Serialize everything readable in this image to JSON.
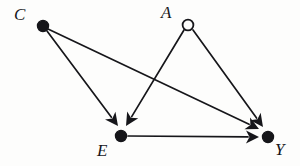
{
  "figure": {
    "kind": "causal-dag",
    "background_color": "#fdfdfc",
    "ink_color": "#16161a",
    "width": 300,
    "height": 166
  },
  "nodes": [
    {
      "id": "C",
      "label": "C",
      "marker": "filled-circle",
      "x": 43,
      "y": 26,
      "radius": 5.6,
      "fill": "#16161a",
      "stroke": "#16161a",
      "label_x": 14,
      "label_y": 6
    },
    {
      "id": "A",
      "label": "A",
      "marker": "open-circle",
      "x": 188,
      "y": 25,
      "radius": 5.4,
      "fill": "#fdfdfc",
      "stroke": "#16161a",
      "label_x": 161,
      "label_y": 4
    },
    {
      "id": "E",
      "label": "E",
      "marker": "filled-circle",
      "x": 121,
      "y": 136,
      "radius": 5.6,
      "fill": "#16161a",
      "stroke": "#16161a",
      "label_x": 97,
      "label_y": 142
    },
    {
      "id": "Y",
      "label": "Y",
      "marker": "filled-circle",
      "x": 268,
      "y": 137,
      "radius": 5.6,
      "fill": "#16161a",
      "stroke": "#16161a",
      "label_x": 275,
      "label_y": 141
    }
  ],
  "edges": [
    {
      "id": "C-E",
      "from": "C",
      "to": "E",
      "arrowhead": "filled-triangle",
      "x1": 47,
      "y1": 31,
      "x2": 118,
      "y2": 126
    },
    {
      "id": "C-Y",
      "from": "C",
      "to": "Y",
      "arrowhead": "filled-triangle",
      "x1": 48,
      "y1": 29,
      "x2": 259,
      "y2": 129
    },
    {
      "id": "A-E",
      "from": "A",
      "to": "E",
      "arrowhead": "filled-triangle",
      "x1": 184,
      "y1": 30,
      "x2": 126,
      "y2": 126
    },
    {
      "id": "A-Y",
      "from": "A",
      "to": "Y",
      "arrowhead": "filled-triangle",
      "x1": 193,
      "y1": 30,
      "x2": 263,
      "y2": 127
    },
    {
      "id": "E-Y",
      "from": "E",
      "to": "Y",
      "arrowhead": "filled-triangle",
      "x1": 128,
      "y1": 136,
      "x2": 259,
      "y2": 137
    }
  ],
  "edge_style": {
    "stroke_width": 1.7,
    "arrow_length": 13,
    "arrow_half_width": 6.5,
    "arrow_notch": 3.5
  },
  "crossings": [
    {
      "edges": [
        "C-Y",
        "A-E"
      ],
      "x": 152,
      "y": 80
    }
  ]
}
